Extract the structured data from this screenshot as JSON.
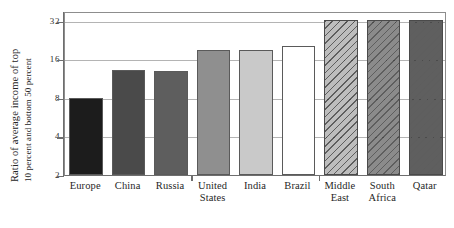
{
  "chart_data": {
    "type": "bar",
    "title": "",
    "xlabel": "",
    "ylabel": "Ratio of average income of top 10 percent and bottom 50 percent",
    "ylabel_line1": "Ratio of average income of top",
    "ylabel_line2": "10 percent and bottom 50 percent",
    "yscale": "log2",
    "ylim": [
      2,
      38
    ],
    "yticks": [
      2,
      4,
      8,
      16,
      32
    ],
    "ytick_labels": [
      "2",
      "4",
      "8",
      "16",
      "32"
    ],
    "grid": "horizontal",
    "legend": "none",
    "categories": [
      "Europe",
      "China",
      "Russia",
      "United States",
      "India",
      "Brazil",
      "Middle East",
      "South Africa",
      "Qatar"
    ],
    "category_lines": [
      [
        "Europe"
      ],
      [
        "China"
      ],
      [
        "Russia"
      ],
      [
        "United",
        "States"
      ],
      [
        "India"
      ],
      [
        "Brazil"
      ],
      [
        "Middle",
        "East"
      ],
      [
        "South",
        "Africa"
      ],
      [
        "Qatar"
      ]
    ],
    "values": [
      8.0,
      13.2,
      13.0,
      19.0,
      18.8,
      20.2,
      36.0,
      36.0,
      36.5
    ],
    "bar_fills": [
      "#1c1c1c",
      "#4a4a4a",
      "#5e5e5e",
      "#8f8f8f",
      "#c9c9c9",
      "#ffffff",
      "#bdbdbd",
      "#8b8b8b",
      "#5f5f5f"
    ],
    "bar_patterns": [
      "solid",
      "solid",
      "solid",
      "solid",
      "solid",
      "solid",
      "diagonal-hatch",
      "diagonal-hatch",
      "diagonal-hatch"
    ]
  },
  "colors": {
    "background": "#ffffff",
    "frame": "#8d8d8d",
    "axis": "#6e6e6e",
    "gridline": "#b4b4b4",
    "text": "#1f1f1f"
  }
}
